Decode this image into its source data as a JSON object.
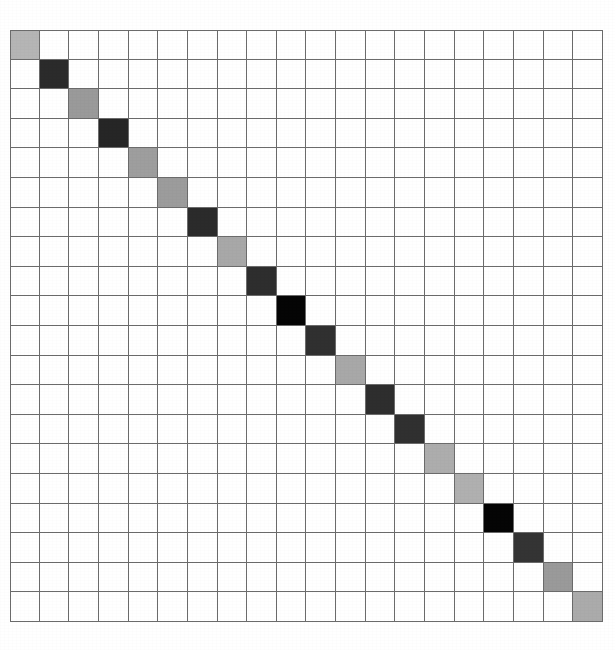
{
  "figure": {
    "kind": "grid-heatmap",
    "background_color": "#ffffff",
    "grid_line_color": "#6b6b6b",
    "empty_cell_color": "#ffffff",
    "left_px": 10,
    "top_px": 30,
    "width_px": 593,
    "height_px": 592
  },
  "chart_data": {
    "type": "heatmap",
    "title": "",
    "subtitle": "",
    "xlabel": "",
    "ylabel": "",
    "xticklabels": [],
    "yticklabels": [],
    "legend": [],
    "annotations": [],
    "grid": true,
    "grid_color": "#6b6b6b",
    "rows": 20,
    "cols": 20,
    "colorscale": "grayscale",
    "categories": [
      "1",
      "2",
      "3",
      "4",
      "5",
      "6",
      "7",
      "8",
      "9",
      "10",
      "11",
      "12",
      "13",
      "14",
      "15",
      "16",
      "17",
      "18",
      "19",
      "20"
    ],
    "diagonal_colors": [
      "#b5b5b5",
      "#2b2b2b",
      "#9a9a9a",
      "#262626",
      "#9e9e9e",
      "#9c9c9c",
      "#2b2b2b",
      "#a8a8a8",
      "#2e2e2e",
      "#050505",
      "#303030",
      "#a8a8a8",
      "#2e2e2e",
      "#303030",
      "#adadad",
      "#b0b0b0",
      "#050505",
      "#343434",
      "#9a9a9a",
      "#ababab"
    ],
    "diagonal_values": [
      0.29,
      0.83,
      0.4,
      0.85,
      0.38,
      0.39,
      0.83,
      0.34,
      0.82,
      0.98,
      0.81,
      0.34,
      0.82,
      0.81,
      0.32,
      0.31,
      0.98,
      0.79,
      0.4,
      0.33
    ],
    "values_note": "values are normalized darkness of each diagonal cell (0 = white, 1 = black)",
    "zlim": [
      0,
      1
    ]
  }
}
